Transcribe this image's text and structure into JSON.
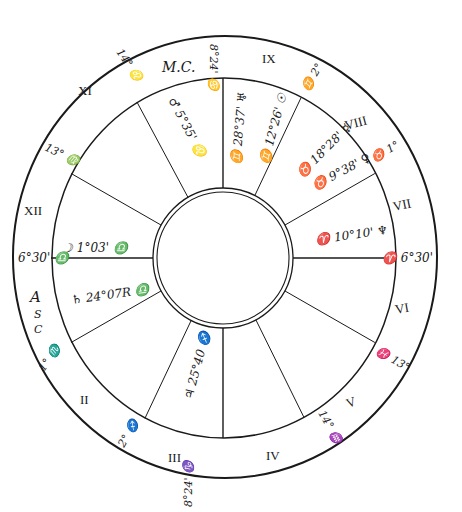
{
  "colors": {
    "ink": "#1a1a1a",
    "paper": "#ffffff"
  },
  "houses": [
    {
      "numeral": "I",
      "label": ""
    },
    {
      "numeral": "II",
      "label": "II"
    },
    {
      "numeral": "III",
      "label": "III"
    },
    {
      "numeral": "IV",
      "label": "IV"
    },
    {
      "numeral": "V",
      "label": "V"
    },
    {
      "numeral": "VI",
      "label": "VI"
    },
    {
      "numeral": "VII",
      "label": "VII"
    },
    {
      "numeral": "VIII",
      "label": "VIII"
    },
    {
      "numeral": "IX",
      "label": "IX"
    },
    {
      "numeral": "X",
      "label": ""
    },
    {
      "numeral": "XI",
      "label": "XI"
    },
    {
      "numeral": "XII",
      "label": "XII"
    }
  ],
  "angles": {
    "mc_label": "M.C.",
    "asc_label": [
      "A",
      "S",
      "C"
    ]
  },
  "cusps": [
    {
      "house": "I",
      "text": "6°30' ♎"
    },
    {
      "house": "II",
      "text": "1° ♏"
    },
    {
      "house": "III",
      "text": "2° ♐"
    },
    {
      "house": "IV",
      "text": "8°24' ♑"
    },
    {
      "house": "V",
      "text": "14° ♒"
    },
    {
      "house": "VI",
      "text": "♓ 13°"
    },
    {
      "house": "VII",
      "text": "♈ 6°30'"
    },
    {
      "house": "VIII",
      "text": "♉ 1°"
    },
    {
      "house": "IX",
      "text": "♊ 2°"
    },
    {
      "house": "X",
      "text": "8°24' ♋"
    },
    {
      "house": "XI",
      "text": "14° ♌"
    },
    {
      "house": "XII",
      "text": "13° ♍"
    }
  ],
  "planets": [
    {
      "symbol": "☽",
      "name": "Moon",
      "text": "☽ 1°03' ♎"
    },
    {
      "symbol": "♄",
      "name": "Saturn",
      "text": "♄ 24°07R ♎"
    },
    {
      "symbol": "♃",
      "name": "Jupiter",
      "text": "♃ 25°40 ♐"
    },
    {
      "symbol": "♆",
      "name": "Neptune",
      "text": "♈ 10°10' ♆"
    },
    {
      "symbol": "♀",
      "name": "Venus",
      "text": "♉ 9°38' ♀"
    },
    {
      "symbol": "☿",
      "name": "Mercury",
      "text": "♉ 18°28' ☿"
    },
    {
      "symbol": "☉",
      "name": "Sun",
      "text": "♊ 12°26' ☉"
    },
    {
      "symbol": "♅",
      "name": "Uranus",
      "text": "♊ 28°37' ♅"
    },
    {
      "symbol": "♂",
      "name": "Mars",
      "text": "♂ 5°35' ♌"
    }
  ]
}
